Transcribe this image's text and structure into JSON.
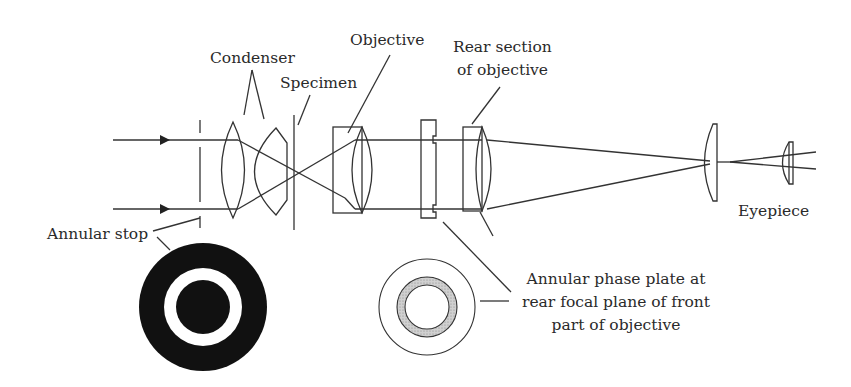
{
  "diagram": {
    "labels": {
      "condenser": "Condenser",
      "specimen": "Specimen",
      "objective": "Objective",
      "rear_section_line1": "Rear section",
      "rear_section_line2": "of objective",
      "eyepiece": "Eyepiece",
      "annular_stop": "Annular stop",
      "phase_plate_line1": "Annular phase plate at",
      "phase_plate_line2": "rear focal plane of front",
      "phase_plate_line3": "part of objective"
    },
    "colors": {
      "line": "#333333",
      "stop_fill": "#111111",
      "phase_ring_fill": "#c8c8c8",
      "background": "#ffffff"
    }
  }
}
